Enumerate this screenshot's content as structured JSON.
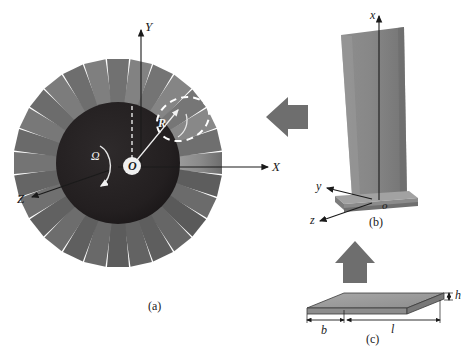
{
  "figure": {
    "background": "#ffffff",
    "width": 467,
    "height": 349
  },
  "colors": {
    "disk_dark": "#231f20",
    "blade_gray": "#8a8a8a",
    "blade_light": "#b4b4b4",
    "blade_dark": "#565656",
    "arrow_gray": "#6e6e6e",
    "axis_black": "#1a1a1a",
    "highlight_white": "#ffffff",
    "plate_fill": "#9a9a9a",
    "plate_edge": "#3a3a3a"
  },
  "panel_a": {
    "caption": "(a)",
    "description": "Front view of rotating bladed disk",
    "blade_count": 28,
    "axes": [
      {
        "name": "Y",
        "label": "Y",
        "direction": "up"
      },
      {
        "name": "X",
        "label": "X",
        "direction": "right"
      },
      {
        "name": "Z",
        "label": "Z",
        "direction": "lower-left"
      }
    ],
    "origin_label": "O",
    "radius_label": "R",
    "rotation_label": "Ω",
    "highlighted_blade": "dashed white ellipse around one blade"
  },
  "panel_b": {
    "caption": "(b)",
    "description": "Single blade with root platform and local coordinate system",
    "axes": [
      {
        "name": "x",
        "label": "x",
        "direction": "up"
      },
      {
        "name": "y",
        "label": "y",
        "direction": "left"
      },
      {
        "name": "z",
        "label": "z",
        "direction": "lower-left"
      }
    ],
    "origin_label": "o"
  },
  "panel_c": {
    "caption": "(c)",
    "description": "Equivalent rectangular plate model of the blade",
    "dimensions": [
      {
        "name": "width",
        "label": "b"
      },
      {
        "name": "length",
        "label": "l"
      },
      {
        "name": "thickness",
        "label": "h"
      }
    ]
  },
  "arrows": [
    {
      "name": "arrow-disk-to-blade",
      "direction": "left",
      "label": ""
    },
    {
      "name": "arrow-plate-to-blade",
      "direction": "up",
      "label": ""
    }
  ]
}
